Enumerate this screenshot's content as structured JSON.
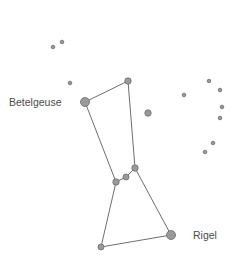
{
  "diagram": {
    "labels": {
      "betelgeuse": "Betelgeuse",
      "rigel": "Rigel"
    },
    "colors": {
      "line": "#6e6e6e",
      "star_fill": "#9a9a9a",
      "star_stroke": "#6a6a6a",
      "label": "#4a4a4a"
    },
    "stars": [
      {
        "name": "betelgeuse",
        "x": 85,
        "y": 102,
        "r": 4.5
      },
      {
        "name": "bellatrix",
        "x": 128,
        "y": 81,
        "r": 3.2
      },
      {
        "name": "belt-left",
        "x": 116,
        "y": 182,
        "r": 3.2
      },
      {
        "name": "belt-middle",
        "x": 126,
        "y": 177,
        "r": 3
      },
      {
        "name": "belt-right",
        "x": 135,
        "y": 168,
        "r": 3.2
      },
      {
        "name": "saiph",
        "x": 101,
        "y": 247,
        "r": 3
      },
      {
        "name": "rigel",
        "x": 171,
        "y": 235,
        "r": 4.5
      },
      {
        "name": "isolated-star",
        "x": 148,
        "y": 113,
        "r": 3.2
      },
      {
        "name": "head-star-1",
        "x": 53,
        "y": 47,
        "r": 1.8
      },
      {
        "name": "head-star-2",
        "x": 62,
        "y": 42,
        "r": 1.8
      },
      {
        "name": "head-star-3",
        "x": 70,
        "y": 83,
        "r": 1.8
      },
      {
        "name": "shield-star-1",
        "x": 184,
        "y": 95,
        "r": 1.8
      },
      {
        "name": "shield-star-2",
        "x": 209,
        "y": 81,
        "r": 1.8
      },
      {
        "name": "shield-star-3",
        "x": 220,
        "y": 90,
        "r": 1.8
      },
      {
        "name": "shield-star-4",
        "x": 222,
        "y": 107,
        "r": 1.8
      },
      {
        "name": "shield-star-5",
        "x": 220,
        "y": 118,
        "r": 1.8
      },
      {
        "name": "shield-star-6",
        "x": 213,
        "y": 143,
        "r": 1.8
      },
      {
        "name": "shield-star-7",
        "x": 205,
        "y": 152,
        "r": 1.8
      }
    ],
    "connections": [
      [
        "betelgeuse",
        "bellatrix"
      ],
      [
        "bellatrix",
        "belt-right"
      ],
      [
        "betelgeuse",
        "belt-left"
      ],
      [
        "belt-left",
        "belt-middle"
      ],
      [
        "belt-middle",
        "belt-right"
      ],
      [
        "belt-left",
        "saiph"
      ],
      [
        "belt-right",
        "rigel"
      ],
      [
        "saiph",
        "rigel"
      ]
    ]
  }
}
